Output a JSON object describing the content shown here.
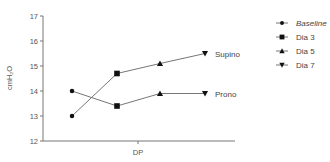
{
  "chart_data": {
    "type": "line",
    "title": "",
    "xlabel": "DP",
    "ylabel": "cmH₂O",
    "ylim": [
      12,
      17
    ],
    "yticks": [
      12,
      13,
      14,
      15,
      16,
      17
    ],
    "grid": false,
    "legend_position": "right",
    "categories": [
      "Baseline",
      "Dia 3",
      "Dia 5",
      "Dia 7"
    ],
    "legend": [
      {
        "label": "Baseline",
        "marker": "circle",
        "italic": true
      },
      {
        "label": "Dia 3",
        "marker": "square",
        "italic": false
      },
      {
        "label": "Dia 5",
        "marker": "triangle-up",
        "italic": false
      },
      {
        "label": "Dia 7",
        "marker": "triangle-down",
        "italic": false
      }
    ],
    "series": [
      {
        "name": "Supino",
        "values": [
          13.0,
          14.7,
          15.1,
          15.5
        ]
      },
      {
        "name": "Prono",
        "values": [
          14.0,
          13.4,
          13.9,
          13.9
        ]
      }
    ],
    "colors": {
      "line": "#666666",
      "marker": "#111111",
      "axis": "#777777"
    }
  }
}
